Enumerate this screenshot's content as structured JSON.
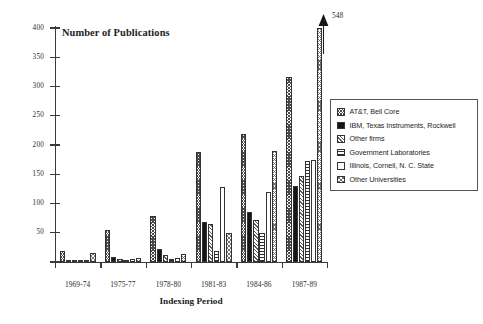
{
  "chart_data": {
    "type": "bar",
    "title": "Number of Publications",
    "xlabel": "Indexing Period",
    "ylabel": "",
    "ylim": [
      0,
      400
    ],
    "ytick_step": 50,
    "grid": false,
    "legend_position": "right",
    "categories": [
      "1969-74",
      "1975-77",
      "1978-80",
      "1981-83",
      "1984-86",
      "1987-89"
    ],
    "yticks": [
      "0",
      "50",
      "100",
      "150",
      "200",
      "250",
      "300",
      "350",
      "400"
    ],
    "annotations": [
      {
        "text": "548",
        "series": "Other Universities",
        "category": "1987-89",
        "note": "bar clipped at axis top, arrow points up"
      }
    ],
    "series": [
      {
        "name": "AT&T, Bell Core",
        "pattern": "dark-checker",
        "values": [
          18,
          55,
          78,
          188,
          218,
          317
        ]
      },
      {
        "name": "IBM, Texas Instruments, Rockwell",
        "pattern": "solid-black",
        "values": [
          2,
          8,
          22,
          68,
          85,
          130
        ]
      },
      {
        "name": "Other firms",
        "pattern": "diagonal",
        "values": [
          3,
          6,
          12,
          65,
          72,
          147
        ]
      },
      {
        "name": "Government Laboratories",
        "pattern": "horizontal",
        "values": [
          1,
          4,
          6,
          18,
          50,
          172
        ]
      },
      {
        "name": "Illinois, Cornell, N. C. State",
        "pattern": "open-white",
        "values": [
          1,
          5,
          7,
          128,
          120,
          175
        ]
      },
      {
        "name": "Other Universities",
        "pattern": "light-checker",
        "values": [
          16,
          7,
          14,
          50,
          190,
          548
        ]
      }
    ]
  },
  "legend": {
    "items": [
      {
        "label": "AT&T, Bell Core",
        "pattern": "dark-checker"
      },
      {
        "label": "IBM, Texas Instruments, Rockwell",
        "pattern": "solid-black"
      },
      {
        "label": "Other firms",
        "pattern": "diagonal"
      },
      {
        "label": "Government Laboratories",
        "pattern": "horizontal"
      },
      {
        "label": "Illinois, Cornell, N. C. State",
        "pattern": "open-white"
      },
      {
        "label": "Other Universities",
        "pattern": "light-checker"
      }
    ]
  },
  "colors": {
    "axis": "#3a3a3a",
    "text": "#222222",
    "background": "#ffffff",
    "bar_outline": "#333333"
  }
}
